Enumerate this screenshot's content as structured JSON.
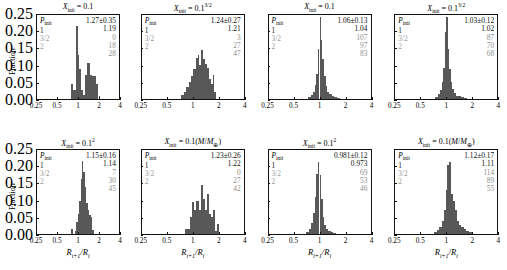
{
  "figure": {
    "ylabel": "Fraction",
    "xlabel_main": "R",
    "xlabel_sub1": "i+1",
    "xlabel_mid": "/R",
    "xlabel_sub2": "i",
    "yticks": [
      "0.25",
      "0.20",
      "0.15",
      "0.10",
      "0.05",
      "0.00"
    ],
    "xticks": [
      "0.25",
      "0.5",
      "1",
      "2",
      "4"
    ],
    "legend_header_text": "P",
    "legend_header_sub": "init",
    "legend_rows": [
      "1",
      "3/2",
      "2"
    ],
    "bar_color": "#585858"
  },
  "chart_data": {
    "type": "bar",
    "xlabel": "R_{i+1}/R_i",
    "ylabel": "Fraction",
    "xscale": "log",
    "xlim": [
      0.25,
      4
    ],
    "ylim": [
      0.0,
      0.25
    ],
    "xticks": [
      0.25,
      0.5,
      1,
      2,
      4
    ],
    "yticks": [
      0.0,
      0.05,
      0.1,
      0.15,
      0.2,
      0.25
    ],
    "grid": false,
    "legend": "in-panel annotation block",
    "panels": [
      {
        "index": 0,
        "row": 0,
        "col": 0,
        "title_var": "X",
        "title_sub": "init",
        "title_value": "0.1",
        "title_sup": "",
        "title_paren": "",
        "mean": "1.27±0.35",
        "median": "1.19",
        "n_p1": "0",
        "n_p32": "18",
        "n_p2": "28",
        "bin_edges": [
          0.8,
          0.85,
          0.9,
          0.95,
          1.0,
          1.05,
          1.1,
          1.18,
          1.26,
          1.34,
          1.42,
          1.5,
          1.6,
          1.72,
          1.86,
          2.0,
          2.1
        ],
        "bin_heights": [
          0.045,
          0.028,
          0.028,
          0.218,
          0.132,
          0.09,
          0.028,
          0.012,
          0.072,
          0.108,
          0.108,
          0.072,
          0.068,
          0.068,
          0.045,
          0.01
        ]
      },
      {
        "index": 1,
        "row": 0,
        "col": 1,
        "title_var": "X",
        "title_sub": "init",
        "title_value": "0.1",
        "title_sup": "3/2",
        "title_paren": "",
        "mean": "1.24±0.27",
        "median": "1.21",
        "n_p1": "3",
        "n_p32": "27",
        "n_p2": "47",
        "bin_edges": [
          0.72,
          0.78,
          0.84,
          0.9,
          0.96,
          1.02,
          1.08,
          1.14,
          1.2,
          1.26,
          1.33,
          1.4,
          1.48,
          1.56,
          1.64,
          1.72,
          1.8,
          1.9
        ],
        "bin_heights": [
          0.012,
          0.022,
          0.036,
          0.05,
          0.068,
          0.09,
          0.122,
          0.132,
          0.1,
          0.145,
          0.118,
          0.105,
          0.092,
          0.06,
          0.045,
          0.072,
          0.022
        ]
      },
      {
        "index": 2,
        "row": 0,
        "col": 2,
        "title_var": "X",
        "title_sub": "init",
        "title_value": "0.1",
        "title_sup": "",
        "title_paren": "",
        "mean": "1.06±0.13",
        "median": "1.04",
        "n_p1": "107",
        "n_p32": "97",
        "n_p2": "83",
        "bin_edges": [
          0.74,
          0.79,
          0.84,
          0.88,
          0.92,
          0.96,
          1.0,
          1.04,
          1.08,
          1.13,
          1.18,
          1.24,
          1.31,
          1.39,
          1.48,
          1.6,
          1.75
        ],
        "bin_heights": [
          0.006,
          0.012,
          0.022,
          0.042,
          0.075,
          0.148,
          0.245,
          0.175,
          0.118,
          0.068,
          0.04,
          0.022,
          0.014,
          0.01,
          0.006,
          0.004
        ]
      },
      {
        "index": 3,
        "row": 0,
        "col": 3,
        "title_var": "X",
        "title_sub": "init",
        "title_value": "0.1",
        "title_sup": "3/2",
        "title_paren": "",
        "mean": "1.03±0.12",
        "median": "1.02",
        "n_p1": "87",
        "n_p32": "70",
        "n_p2": "68",
        "bin_edges": [
          0.74,
          0.79,
          0.84,
          0.88,
          0.92,
          0.96,
          1.0,
          1.04,
          1.08,
          1.13,
          1.18,
          1.24,
          1.31,
          1.39,
          1.48,
          1.6,
          1.75
        ],
        "bin_heights": [
          0.006,
          0.014,
          0.028,
          0.052,
          0.092,
          0.2,
          0.243,
          0.15,
          0.09,
          0.052,
          0.03,
          0.018,
          0.01,
          0.008,
          0.005,
          0.003
        ]
      },
      {
        "index": 4,
        "row": 1,
        "col": 0,
        "title_var": "X",
        "title_sub": "init",
        "title_value": "0.1",
        "title_sup": "2",
        "title_paren": "",
        "mean": "1.15±0.16",
        "median": "1.14",
        "n_p1": "7",
        "n_p32": "30",
        "n_p2": "45",
        "bin_edges": [
          0.78,
          0.84,
          0.9,
          0.95,
          1.0,
          1.05,
          1.1,
          1.15,
          1.2,
          1.26,
          1.32,
          1.39,
          1.46,
          1.54,
          1.63,
          1.72
        ],
        "bin_heights": [
          0.014,
          0.0,
          0.01,
          0.035,
          0.06,
          0.098,
          0.165,
          0.218,
          0.185,
          0.14,
          0.092,
          0.072,
          0.058,
          0.052,
          0.012
        ]
      },
      {
        "index": 5,
        "row": 1,
        "col": 1,
        "title_var": "X",
        "title_sub": "init",
        "title_value": "0.1",
        "title_sup": "",
        "title_paren": "(M/M⊕)",
        "mean": "1.23±0.26",
        "median": "1.22",
        "n_p1": "0",
        "n_p32": "27",
        "n_p2": "42",
        "bin_edges": [
          0.8,
          0.86,
          0.92,
          0.98,
          1.04,
          1.1,
          1.17,
          1.24,
          1.31,
          1.38,
          1.46,
          1.54,
          1.63,
          1.72,
          1.82,
          1.92,
          2.02
        ],
        "bin_heights": [
          0.015,
          0.015,
          0.052,
          0.095,
          0.072,
          0.098,
          0.072,
          0.145,
          0.105,
          0.072,
          0.118,
          0.06,
          0.05,
          0.072,
          0.01,
          0.03
        ]
      },
      {
        "index": 6,
        "row": 1,
        "col": 2,
        "title_var": "X",
        "title_sub": "init",
        "title_value": "0.1",
        "title_sup": "2",
        "title_paren": "",
        "mean": "0.981±0.12",
        "median": "0.973",
        "n_p1": "69",
        "n_p32": "53",
        "n_p2": "46",
        "bin_edges": [
          0.7,
          0.75,
          0.8,
          0.84,
          0.88,
          0.92,
          0.96,
          1.0,
          1.04,
          1.09,
          1.14,
          1.2,
          1.27,
          1.35,
          1.45,
          1.58
        ],
        "bin_heights": [
          0.006,
          0.014,
          0.032,
          0.062,
          0.11,
          0.178,
          0.215,
          0.175,
          0.105,
          0.052,
          0.028,
          0.016,
          0.01,
          0.006,
          0.004
        ]
      },
      {
        "index": 7,
        "row": 1,
        "col": 3,
        "title_var": "X",
        "title_sub": "init",
        "title_value": "0.1",
        "title_sup": "",
        "title_paren": "(M/M⊕)",
        "mean": "1.12±0.17",
        "median": "1.11",
        "n_p1": "114",
        "n_p32": "89",
        "n_p2": "55",
        "bin_edges": [
          0.72,
          0.78,
          0.83,
          0.88,
          0.93,
          0.98,
          1.03,
          1.08,
          1.14,
          1.2,
          1.27,
          1.34,
          1.42,
          1.51,
          1.61,
          1.72,
          1.85,
          2.0
        ],
        "bin_heights": [
          0.006,
          0.012,
          0.022,
          0.038,
          0.07,
          0.13,
          0.205,
          0.215,
          0.118,
          0.098,
          0.072,
          0.04,
          0.028,
          0.02,
          0.014,
          0.01,
          0.005
        ]
      }
    ]
  }
}
